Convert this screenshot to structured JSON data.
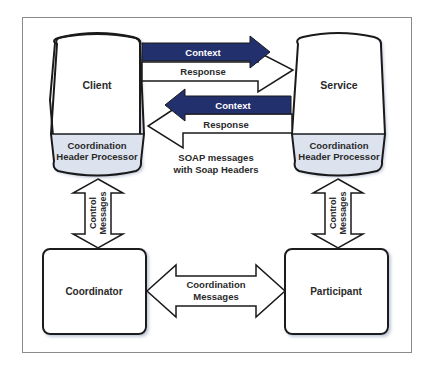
{
  "diagram": {
    "nodes": {
      "client": {
        "label": "Client",
        "processor_line1": "Coordination",
        "processor_line2": "Header Processor"
      },
      "service": {
        "label": "Service",
        "processor_line1": "Coordination",
        "processor_line2": "Header Processor"
      },
      "coordinator": {
        "label": "Coordinator"
      },
      "participant": {
        "label": "Participant"
      }
    },
    "arrows": {
      "top_context": {
        "label": "Context",
        "direction": "client-to-service"
      },
      "top_response": {
        "label": "Response",
        "direction": "client-to-service"
      },
      "bottom_context": {
        "label": "Context",
        "direction": "service-to-client"
      },
      "bottom_response": {
        "label": "Response",
        "direction": "service-to-client"
      },
      "control_left": {
        "line1": "Control",
        "line2": "Messages",
        "direction": "bidirectional"
      },
      "control_right": {
        "line1": "Control",
        "line2": "Messages",
        "direction": "bidirectional"
      },
      "coordination": {
        "line1": "Coordination",
        "line2": "Messages",
        "direction": "bidirectional"
      }
    },
    "annotation": {
      "line1": "SOAP messages",
      "line2": "with Soap Headers"
    },
    "colors": {
      "context_arrow": "#22306e",
      "processor_fill": "#dde3ee",
      "outline": "#1a1a1a",
      "frame": "#8a8a8a"
    }
  }
}
